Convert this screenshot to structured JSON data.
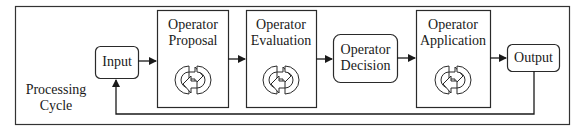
{
  "diagram": {
    "frame_label": [
      "Processing",
      "Cycle"
    ],
    "nodes": {
      "input": "Input",
      "proposal": [
        "Operator",
        "Proposal"
      ],
      "evaluation": [
        "Operator",
        "Evaluation"
      ],
      "decision": [
        "Operator",
        "Decision"
      ],
      "application": [
        "Operator",
        "Application"
      ],
      "output": "Output"
    },
    "cycle_icon": "cycle-arrows-icon",
    "colors": {
      "stroke": "#2a2a2a",
      "background": "#ffffff"
    }
  }
}
